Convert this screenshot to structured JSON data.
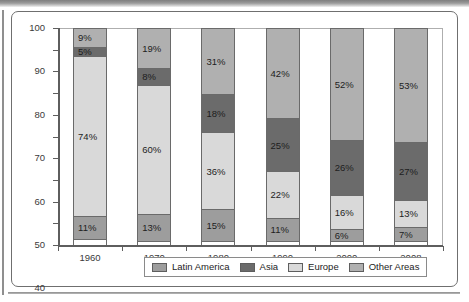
{
  "chart_data": {
    "type": "bar",
    "subtype": "stacked-bar-100-percent",
    "title": "",
    "xlabel": "",
    "ylabel": "",
    "ylim": [
      0,
      100
    ],
    "yticks": [
      0,
      10,
      20,
      30,
      40,
      50,
      60,
      70,
      80,
      90,
      100
    ],
    "grid": false,
    "legend_position": "bottom",
    "categories": [
      "1960",
      "1970",
      "1980",
      "1990",
      "2000",
      "2008"
    ],
    "series": [
      {
        "name": "Latin America",
        "color": "#9d9d9d",
        "values": [
          11,
          13,
          15,
          11,
          6,
          7
        ],
        "labels": [
          "11%",
          "13%",
          "15%",
          "11%",
          "6%",
          "7%"
        ]
      },
      {
        "name": "Europe",
        "color": "#d9d9d9",
        "values": [
          74,
          60,
          36,
          22,
          16,
          13
        ],
        "labels": [
          "74%",
          "60%",
          "36%",
          "22%",
          "16%",
          "13%"
        ]
      },
      {
        "name": "Asia",
        "color": "#6b6b6b",
        "values": [
          5,
          8,
          18,
          25,
          26,
          27
        ],
        "labels": [
          "5%",
          "8%",
          "18%",
          "25%",
          "26%",
          "27%"
        ]
      },
      {
        "name": "Other Areas",
        "color": "#b0b0b0",
        "values": [
          9,
          19,
          31,
          42,
          52,
          53
        ],
        "labels": [
          "9%",
          "19%",
          "31%",
          "42%",
          "52%",
          "53%"
        ]
      }
    ]
  },
  "legend": {
    "items": [
      {
        "label": "Latin America",
        "color": "#9d9d9d"
      },
      {
        "label": "Asia",
        "color": "#6b6b6b"
      },
      {
        "label": "Europe",
        "color": "#d9d9d9"
      },
      {
        "label": "Other Areas",
        "color": "#b0b0b0"
      }
    ]
  },
  "axis": {
    "y_tick_labels": [
      "100",
      "90",
      "80",
      "70",
      "60",
      "50",
      "40",
      "30",
      "20",
      "10",
      "0"
    ],
    "x_tick_labels": [
      "1960",
      "1970",
      "1980",
      "1990",
      "2000",
      "2008"
    ]
  }
}
